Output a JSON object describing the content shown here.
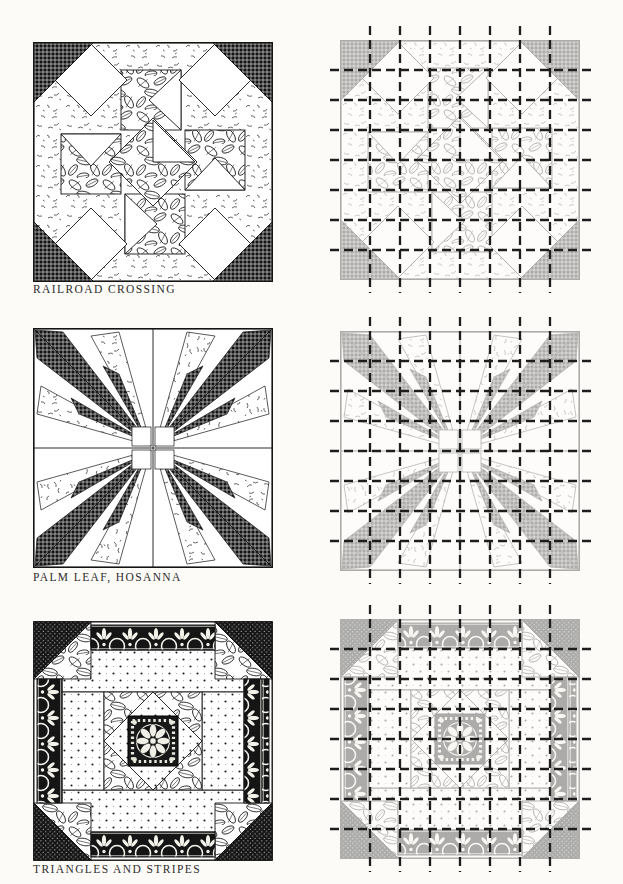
{
  "page": {
    "background_color": "#fcfbf8",
    "ink_color": "#1a1a1a",
    "grid_dash_color": "#1d1d1d",
    "faded_block_opacity": 0.34,
    "grid_lines_per_direction": 7
  },
  "patterns": [
    {
      "caption": "RAILROAD CROSSING"
    },
    {
      "caption": "PALM LEAF, HOSANNA"
    },
    {
      "caption": "TRIANGLES AND STRIPES"
    }
  ]
}
